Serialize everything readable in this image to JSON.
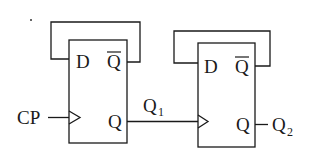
{
  "diagram": {
    "type": "circuit",
    "input_label": "CP",
    "flipflops": [
      {
        "id": "FF1",
        "d_label": "D",
        "qbar_label": "Q",
        "q_label": "Q",
        "output_name": "Q",
        "output_sub": "1"
      },
      {
        "id": "FF2",
        "d_label": "D",
        "qbar_label": "Q",
        "q_label": "Q",
        "output_name": "Q",
        "output_sub": "2"
      }
    ],
    "colors": {
      "line": "#1a1a1a",
      "background": "#ffffff"
    }
  }
}
